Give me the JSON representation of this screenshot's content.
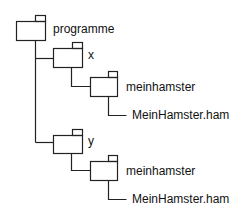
{
  "diagram": {
    "type": "directory-tree",
    "line_color": "#222222",
    "nodes": [
      {
        "id": "programme",
        "label": "programme",
        "kind": "folder",
        "depth": 0
      },
      {
        "id": "x",
        "label": "x",
        "kind": "folder",
        "depth": 1,
        "parent": "programme"
      },
      {
        "id": "x-meinhamster",
        "label": "meinhamster",
        "kind": "folder",
        "depth": 2,
        "parent": "x"
      },
      {
        "id": "x-file",
        "label": "MeinHamster.ham",
        "kind": "file",
        "depth": 3,
        "parent": "x-meinhamster"
      },
      {
        "id": "y",
        "label": "y",
        "kind": "folder",
        "depth": 1,
        "parent": "programme"
      },
      {
        "id": "y-meinhamster",
        "label": "meinhamster",
        "kind": "folder",
        "depth": 2,
        "parent": "y"
      },
      {
        "id": "y-file",
        "label": "MeinHamster.ham",
        "kind": "file",
        "depth": 3,
        "parent": "y-meinhamster"
      }
    ]
  }
}
